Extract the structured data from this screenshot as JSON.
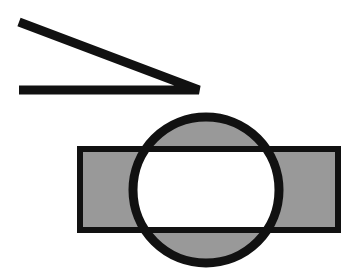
{
  "canvas": {
    "width": 356,
    "height": 278,
    "background_color": "#ffffff",
    "title": "Abstract geometric figure"
  },
  "palette": {
    "stroke_color": "#111111",
    "fill_gray": "#999999",
    "fill_white": "#ffffff",
    "background": "#ffffff"
  },
  "shapes": {
    "angle": {
      "name": "acute-angle",
      "label": "Acute angle made of two thick black segments",
      "stroke_width": 9,
      "vertex": {
        "x": 199,
        "y": 90
      },
      "upper_arm_end": {
        "x": 19,
        "y": 22
      },
      "lower_arm_end": {
        "x": 19,
        "y": 90
      },
      "upper_arm_length": 194,
      "lower_arm_length": 180,
      "angle_degrees": 20.7,
      "color": "#111111"
    },
    "rectangle": {
      "name": "horizontal-rectangle",
      "label": "Horizontal rectangle with black outline and gray fill",
      "x": 80,
      "y": 149,
      "width": 258,
      "height": 81,
      "stroke_width": 6,
      "fill": "#999999",
      "stroke": "#111111"
    },
    "circle": {
      "name": "overlapping-circle",
      "label": "Circle with black outline and gray fill overlapping the rectangle",
      "cx": 206,
      "cy": 190,
      "r": 73,
      "stroke_width": 9,
      "fill": "#999999",
      "stroke": "#111111"
    },
    "overlap": {
      "name": "intersection-region",
      "label": "Intersection of circle and rectangle rendered white",
      "fill": "#ffffff",
      "mode": "xor"
    }
  },
  "figure_caption": "Two black line segments forming a narrow angle above a gray circle overlapping a gray rectangle, their shared area shown in white."
}
